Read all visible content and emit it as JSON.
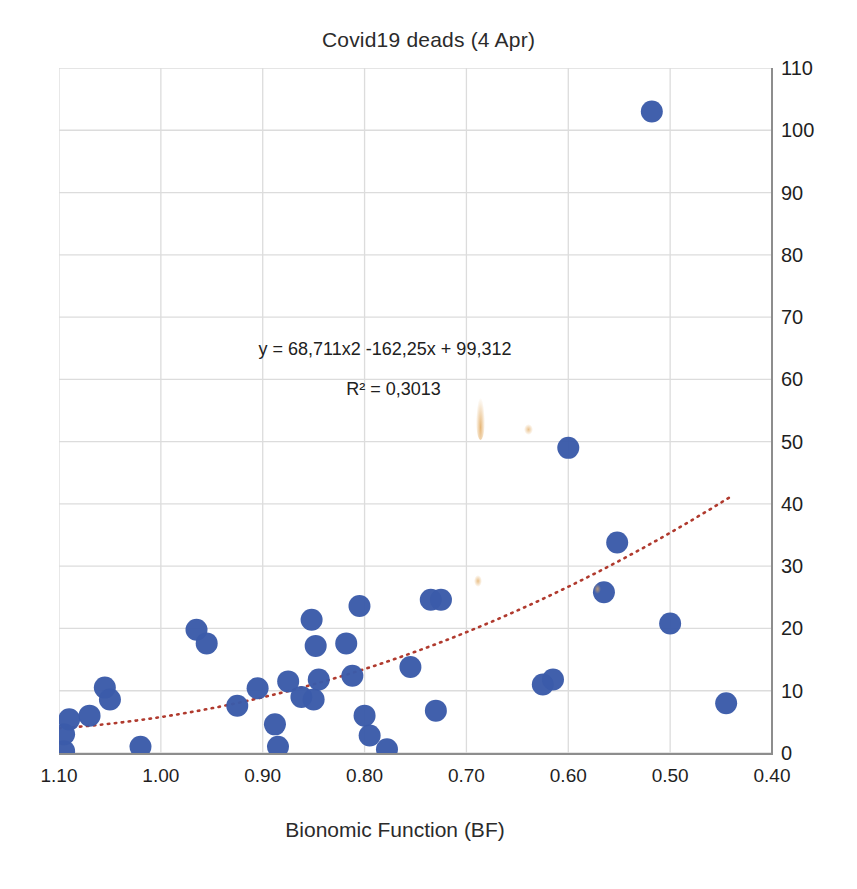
{
  "chart_data": {
    "type": "scatter",
    "title": "Covid19 deads (4 Apr)",
    "xlabel": "Bionomic Function (BF)",
    "ylabel": "",
    "xlim": [
      1.1,
      0.4
    ],
    "ylim": [
      0,
      110
    ],
    "x_reversed": true,
    "y_axis_position": "right",
    "grid": true,
    "legend": false,
    "xticks": [
      "1.10",
      "1.00",
      "0.90",
      "0.80",
      "0.70",
      "0.60",
      "0.50",
      "0.40"
    ],
    "xtick_values": [
      1.1,
      1.0,
      0.9,
      0.8,
      0.7,
      0.6,
      0.5,
      0.4
    ],
    "yticks": [
      "0",
      "10",
      "20",
      "30",
      "40",
      "50",
      "60",
      "70",
      "80",
      "90",
      "100",
      "110"
    ],
    "ytick_values": [
      0,
      10,
      20,
      30,
      40,
      50,
      60,
      70,
      80,
      90,
      100,
      110
    ],
    "marker_color": "#3b5ba9",
    "marker_size": 11,
    "annotations": [
      "y = 68,711x2 -162,25x + 99,312",
      "R² = 0,3013"
    ],
    "trendline": {
      "type": "polynomial",
      "order": 2,
      "equation": "y = 68,711x2 -162,25x + 99,312",
      "r_squared": "0,3013",
      "color": "#b03a2e",
      "style": "dotted",
      "x_start": 1.1,
      "x_end": 0.44
    },
    "points": [
      {
        "x": 1.095,
        "y": 0.3
      },
      {
        "x": 1.095,
        "y": 3.0
      },
      {
        "x": 1.09,
        "y": 5.4
      },
      {
        "x": 1.07,
        "y": 6.0
      },
      {
        "x": 1.055,
        "y": 10.5
      },
      {
        "x": 1.05,
        "y": 8.6
      },
      {
        "x": 1.02,
        "y": 1.0
      },
      {
        "x": 0.965,
        "y": 19.8
      },
      {
        "x": 0.955,
        "y": 17.6
      },
      {
        "x": 0.925,
        "y": 7.6
      },
      {
        "x": 0.905,
        "y": 10.4
      },
      {
        "x": 0.888,
        "y": 4.6
      },
      {
        "x": 0.885,
        "y": 1.0
      },
      {
        "x": 0.875,
        "y": 11.5
      },
      {
        "x": 0.862,
        "y": 9.0
      },
      {
        "x": 0.852,
        "y": 21.4
      },
      {
        "x": 0.85,
        "y": 8.6
      },
      {
        "x": 0.848,
        "y": 17.2
      },
      {
        "x": 0.845,
        "y": 11.8
      },
      {
        "x": 0.818,
        "y": 17.6
      },
      {
        "x": 0.812,
        "y": 12.4
      },
      {
        "x": 0.805,
        "y": 23.6
      },
      {
        "x": 0.8,
        "y": 6.0
      },
      {
        "x": 0.795,
        "y": 2.8
      },
      {
        "x": 0.778,
        "y": 0.6
      },
      {
        "x": 0.755,
        "y": 13.8
      },
      {
        "x": 0.735,
        "y": 24.6
      },
      {
        "x": 0.73,
        "y": 6.8
      },
      {
        "x": 0.725,
        "y": 24.6
      },
      {
        "x": 0.625,
        "y": 11.0
      },
      {
        "x": 0.615,
        "y": 11.8
      },
      {
        "x": 0.6,
        "y": 49.0
      },
      {
        "x": 0.565,
        "y": 25.8
      },
      {
        "x": 0.552,
        "y": 33.8
      },
      {
        "x": 0.518,
        "y": 103.0
      },
      {
        "x": 0.5,
        "y": 20.8
      },
      {
        "x": 0.445,
        "y": 8.0
      }
    ]
  }
}
